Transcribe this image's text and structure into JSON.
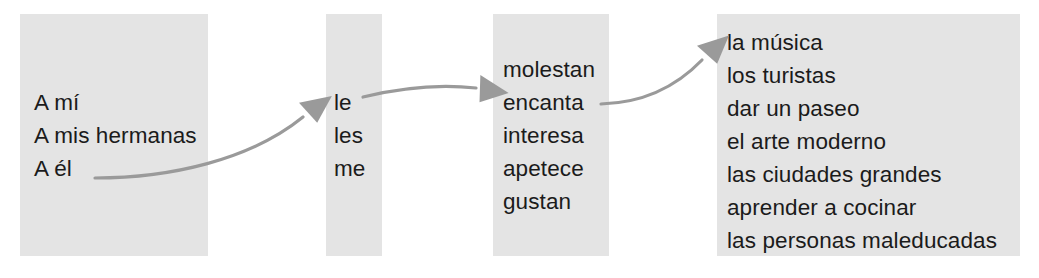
{
  "diagram": {
    "type": "sentence-builder-flow",
    "language": "Spanish",
    "direction": "left-to-right",
    "colors": {
      "panel_background": "#e4e4e4",
      "text": "#1b1b1b",
      "arrow": "#9a9a9a",
      "page_background": "#ffffff"
    },
    "columns": [
      {
        "id": "subjects",
        "name": "indirect-object-phrases",
        "items": [
          "A mí",
          "A mis hermanas",
          "A él"
        ]
      },
      {
        "id": "pronouns",
        "name": "indirect-object-pronouns",
        "items": [
          "le",
          "les",
          "me"
        ]
      },
      {
        "id": "verbs",
        "name": "gustar-type-verbs",
        "items": [
          "molestan",
          "encanta",
          "interesa",
          "apetece",
          "gustan"
        ]
      },
      {
        "id": "objects",
        "name": "subject-noun-phrases",
        "items": [
          "la música",
          "los turistas",
          "dar un paseo",
          "el arte moderno",
          "las ciudades grandes",
          "aprender a cocinar",
          "las personas maleducadas"
        ]
      }
    ],
    "arrows": [
      {
        "id": "arrow-subjects-to-pronouns",
        "from": "subjects",
        "to": "pronouns"
      },
      {
        "id": "arrow-pronouns-to-verbs",
        "from": "pronouns",
        "to": "verbs"
      },
      {
        "id": "arrow-verbs-to-objects",
        "from": "verbs",
        "to": "objects"
      }
    ]
  }
}
